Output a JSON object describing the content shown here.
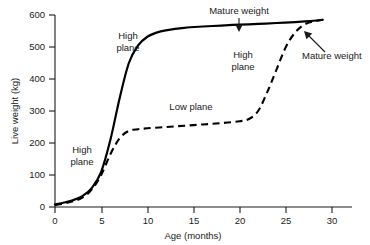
{
  "chart_data": {
    "type": "line",
    "title": "",
    "xlabel": "Age (months)",
    "ylabel": "Live weight (kg)",
    "xlim": [
      0,
      31
    ],
    "ylim": [
      0,
      620
    ],
    "xticks": [
      0,
      5,
      10,
      15,
      20,
      25,
      30
    ],
    "xtick_labels": [
      "0",
      "5",
      "10",
      "15",
      "20",
      "25",
      "30"
    ],
    "yticks": [
      0,
      100,
      200,
      300,
      400,
      500,
      600
    ],
    "ytick_labels": [
      "0",
      "100",
      "200",
      "300",
      "400",
      "500",
      "600"
    ],
    "grid": false,
    "legend": "none",
    "series": [
      {
        "name": "High plane",
        "style": "solid",
        "x": [
          0,
          1,
          2,
          3,
          4,
          5,
          6,
          7,
          8,
          9,
          10,
          11,
          12,
          14,
          16,
          18,
          20,
          22,
          24,
          26,
          28,
          29
        ],
        "y": [
          8,
          14,
          22,
          35,
          60,
          110,
          210,
          340,
          450,
          505,
          532,
          545,
          552,
          560,
          564,
          567,
          570,
          572,
          575,
          578,
          582,
          585
        ]
      },
      {
        "name": "Low plane",
        "style": "dashed",
        "x": [
          0,
          1,
          2,
          3,
          4,
          5,
          6,
          7,
          8,
          9,
          10,
          12,
          14,
          16,
          18,
          20,
          21,
          22,
          23,
          24,
          25,
          26,
          27,
          28,
          29
        ],
        "y": [
          6,
          11,
          18,
          30,
          55,
          100,
          165,
          215,
          238,
          243,
          246,
          250,
          254,
          258,
          262,
          268,
          275,
          300,
          360,
          430,
          500,
          545,
          570,
          580,
          585
        ]
      }
    ],
    "annotations": [
      {
        "name": "mature-weight-solid",
        "text": "Mature weight",
        "label_x": 213,
        "label_y": 13,
        "arrow_from_x": 239,
        "arrow_from_y": 17,
        "arrow_to_x": 239,
        "arrow_to_y": 31
      },
      {
        "name": "mature-weight-dashed",
        "text": "Mature weight",
        "label_x": 300,
        "label_y": 56,
        "arrow_from_x": 322,
        "arrow_from_y": 50,
        "arrow_to_x": 305,
        "arrow_to_y": 34
      },
      {
        "name": "high-plane-left",
        "text_line1": "High",
        "text_line2": "plane",
        "label_x": 82,
        "label_y": 152
      },
      {
        "name": "high-plane-upper",
        "text_line1": "High",
        "text_line2": "plane",
        "label_x": 127,
        "label_y": 38
      },
      {
        "name": "high-plane-right",
        "text_line1": "High",
        "text_line2": "plane",
        "label_x": 242,
        "label_y": 57
      },
      {
        "name": "low-plane",
        "text": "Low plane",
        "label_x": 190,
        "label_y": 107
      }
    ]
  },
  "colors": {
    "ink": "#1a1a1a",
    "curve": "#000000",
    "background": "#ffffff"
  }
}
